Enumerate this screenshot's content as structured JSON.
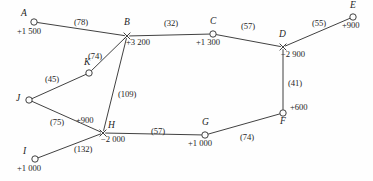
{
  "diagram": {
    "type": "undirected-weighted-network",
    "title": "",
    "nodes": [
      {
        "id": "A",
        "label": "A",
        "value": "+1 500",
        "marker": "circle",
        "x": 34,
        "y": 22,
        "name_dx": -13,
        "name_dy": -13,
        "val_dx": -17,
        "val_dy": 5
      },
      {
        "id": "B",
        "label": "B",
        "value": "+3 200",
        "marker": "cross",
        "x": 127,
        "y": 36,
        "name_dx": -3,
        "name_dy": -18,
        "val_dx": -1,
        "val_dy": 2
      },
      {
        "id": "C",
        "label": "C",
        "value": "+1 300",
        "marker": "circle",
        "x": 213,
        "y": 34,
        "name_dx": -3,
        "name_dy": -17,
        "val_dx": -17,
        "val_dy": 4
      },
      {
        "id": "D",
        "label": "D",
        "value": "−2 900",
        "marker": "cross",
        "x": 283,
        "y": 47,
        "name_dx": -4,
        "name_dy": -17,
        "val_dx": -2,
        "val_dy": 3
      },
      {
        "id": "E",
        "label": "E",
        "value": "+900",
        "marker": "circle",
        "x": 353,
        "y": 17,
        "name_dx": -3,
        "name_dy": -16,
        "val_dx": -11,
        "val_dy": 4
      },
      {
        "id": "F",
        "label": "F",
        "value": "+600",
        "marker": "circle",
        "x": 283,
        "y": 113,
        "name_dx": -3,
        "name_dy": 4,
        "val_dx": 7,
        "val_dy": -10
      },
      {
        "id": "G",
        "label": "G",
        "value": "+1 000",
        "marker": "circle",
        "x": 205,
        "y": 135,
        "name_dx": -3,
        "name_dy": -17,
        "val_dx": -17,
        "val_dy": 4
      },
      {
        "id": "H",
        "label": "H",
        "value": "−2 000",
        "marker": "cross",
        "x": 103,
        "y": 133,
        "name_dx": 5,
        "name_dy": -12,
        "val_dx": -2,
        "val_dy": 2
      },
      {
        "id": "I",
        "label": "I",
        "value": "+1 000",
        "marker": "circle",
        "x": 35,
        "y": 159,
        "name_dx": -12,
        "name_dy": -12,
        "val_dx": -18,
        "val_dy": 5
      },
      {
        "id": "J",
        "label": "J",
        "value": "",
        "marker": "circle",
        "x": 29,
        "y": 100,
        "name_dx": -13,
        "name_dy": -6,
        "val_dx": 0,
        "val_dy": 0
      },
      {
        "id": "K",
        "label": "K",
        "value": "",
        "marker": "circle",
        "x": 89,
        "y": 73,
        "name_dx": -5,
        "name_dy": -15,
        "val_dx": 0,
        "val_dy": 0
      }
    ],
    "extra_values": [
      {
        "id": "H-plus",
        "text": "+900",
        "x": 76,
        "y": 116
      }
    ],
    "edges": [
      {
        "from": "A",
        "to": "B",
        "weight": "(78)",
        "lx": 74,
        "ly": 18
      },
      {
        "from": "B",
        "to": "C",
        "weight": "(32)",
        "lx": 164,
        "ly": 19
      },
      {
        "from": "C",
        "to": "D",
        "weight": "(57)",
        "lx": 241,
        "ly": 22
      },
      {
        "from": "D",
        "to": "E",
        "weight": "(55)",
        "lx": 312,
        "ly": 19
      },
      {
        "from": "D",
        "to": "F",
        "weight": "(41)",
        "lx": 288,
        "ly": 79
      },
      {
        "from": "F",
        "to": "G",
        "weight": "(74)",
        "lx": 240,
        "ly": 133
      },
      {
        "from": "G",
        "to": "H",
        "weight": "(57)",
        "lx": 151,
        "ly": 127
      },
      {
        "from": "H",
        "to": "B",
        "weight": "(109)",
        "lx": 118,
        "ly": 90
      },
      {
        "from": "H",
        "to": "J",
        "weight": "(75)",
        "lx": 50,
        "ly": 118
      },
      {
        "from": "H",
        "to": "I",
        "weight": "(132)",
        "lx": 74,
        "ly": 145
      },
      {
        "from": "J",
        "to": "K",
        "weight": "(45)",
        "lx": 45,
        "ly": 75
      },
      {
        "from": "K",
        "to": "B",
        "weight": "(74)",
        "lx": 88,
        "ly": 52
      }
    ],
    "colors": {
      "stroke": "#2b2b2b",
      "text": "#1d1d1d",
      "background": "#fefefe"
    }
  }
}
